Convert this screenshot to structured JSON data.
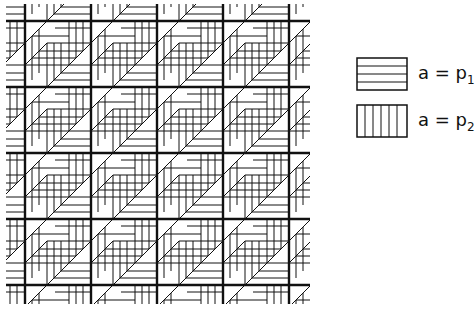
{
  "figure": {
    "lattice_period_px": 66,
    "grid_lines": {
      "vertical_x": [
        25,
        91,
        157,
        223,
        289
      ],
      "horizontal_y": [
        21,
        87,
        153,
        219,
        285
      ]
    },
    "stroke_color": "#111111"
  },
  "legend": {
    "items": [
      {
        "hatch": "horizontal",
        "label_main": "a = p",
        "label_sub": "1"
      },
      {
        "hatch": "vertical",
        "label_main": "a = p",
        "label_sub": "2"
      }
    ]
  }
}
